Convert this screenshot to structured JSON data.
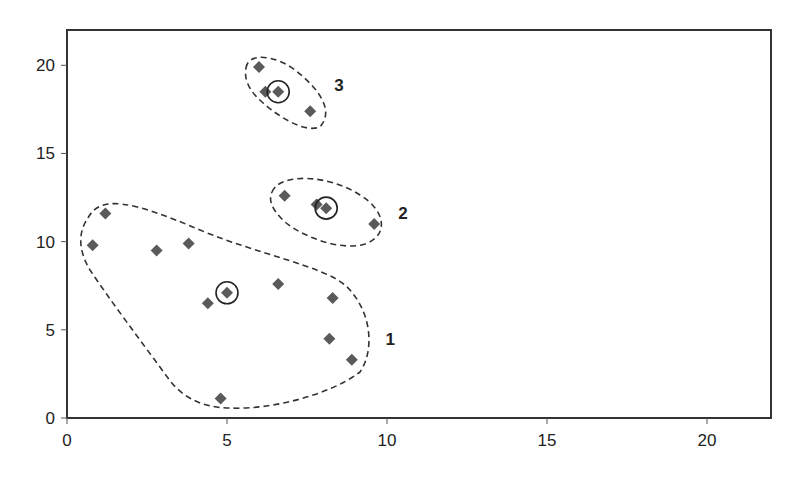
{
  "chart_data": {
    "type": "scatter",
    "title": "",
    "xlabel": "",
    "ylabel": "",
    "xlim": [
      0,
      22
    ],
    "ylim": [
      0,
      22
    ],
    "xticks": [
      0,
      5,
      10,
      15,
      20
    ],
    "yticks": [
      0,
      5,
      10,
      15,
      20
    ],
    "grid": false,
    "marker": "diamond",
    "marker_color": "#5a5a5a",
    "clusters": [
      {
        "label": "1",
        "points": [
          [
            1.2,
            11.6
          ],
          [
            0.8,
            9.8
          ],
          [
            2.8,
            9.5
          ],
          [
            3.8,
            9.9
          ],
          [
            4.4,
            6.5
          ],
          [
            5.0,
            7.1
          ],
          [
            6.6,
            7.6
          ],
          [
            8.3,
            6.8
          ],
          [
            8.2,
            4.5
          ],
          [
            8.9,
            3.3
          ],
          [
            4.8,
            1.1
          ]
        ],
        "centroid": [
          5.0,
          7.1
        ],
        "label_pos": [
          10.1,
          4.5
        ]
      },
      {
        "label": "2",
        "points": [
          [
            6.8,
            12.6
          ],
          [
            7.8,
            12.1
          ],
          [
            8.1,
            11.9
          ],
          [
            9.6,
            11.0
          ]
        ],
        "centroid": [
          8.1,
          11.9
        ],
        "label_pos": [
          10.5,
          11.6
        ]
      },
      {
        "label": "3",
        "points": [
          [
            6.0,
            19.9
          ],
          [
            6.2,
            18.5
          ],
          [
            6.6,
            18.5
          ],
          [
            7.6,
            17.4
          ]
        ],
        "centroid": [
          6.6,
          18.5
        ],
        "label_pos": [
          8.5,
          18.9
        ]
      }
    ]
  }
}
